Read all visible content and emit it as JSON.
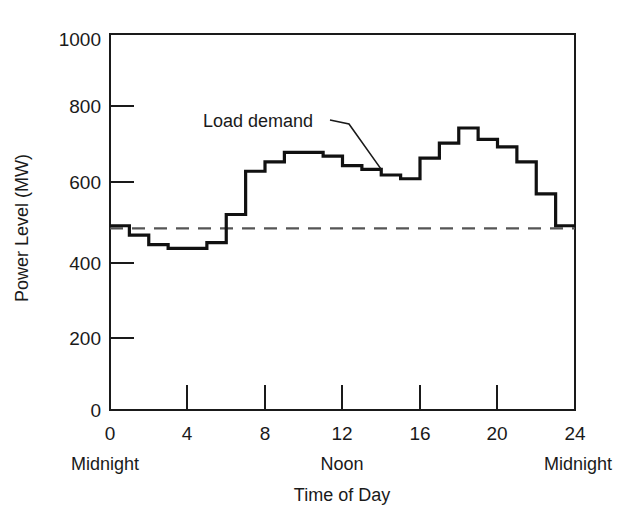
{
  "chart_data": {
    "type": "line",
    "subtype": "step",
    "title": "",
    "xlabel": "Time of Day",
    "ylabel": "Power Level (MW)",
    "xlim": [
      0,
      24
    ],
    "ylim": [
      0,
      1000
    ],
    "grid": false,
    "legend_position": "inline-annotation",
    "x_ticks": [
      0,
      4,
      8,
      12,
      16,
      20,
      24
    ],
    "x_tick_labels": [
      "0",
      "4",
      "8",
      "12",
      "16",
      "20",
      "24"
    ],
    "y_ticks": [
      0,
      200,
      400,
      600,
      800,
      1000
    ],
    "y_tick_labels": [
      "0",
      "200",
      "400",
      "600",
      "800",
      "1000"
    ],
    "x_edge_labels": [
      {
        "at": 0,
        "text": "Midnight"
      },
      {
        "at": 12,
        "text": "Noon"
      },
      {
        "at": 24,
        "text": "Midnight"
      }
    ],
    "annotations": [
      {
        "text": "Load demand",
        "points_to_hour": 14,
        "points_to_value": 640
      }
    ],
    "series": [
      {
        "name": "Load demand",
        "style": "step-post",
        "color": "#111111",
        "x": [
          0,
          1,
          2,
          3,
          4,
          5,
          6,
          7,
          8,
          9,
          10,
          11,
          12,
          13,
          14,
          15,
          16,
          17,
          18,
          19,
          20,
          21,
          22,
          23,
          24
        ],
        "values": [
          490,
          465,
          440,
          430,
          430,
          445,
          520,
          635,
          660,
          685,
          685,
          675,
          650,
          640,
          625,
          615,
          670,
          710,
          750,
          720,
          700,
          660,
          575,
          490,
          490
        ]
      },
      {
        "name": "Base level",
        "style": "dashed-horizontal",
        "color": "#555555",
        "constant_value": 483,
        "x_range": [
          0,
          24
        ]
      }
    ]
  }
}
